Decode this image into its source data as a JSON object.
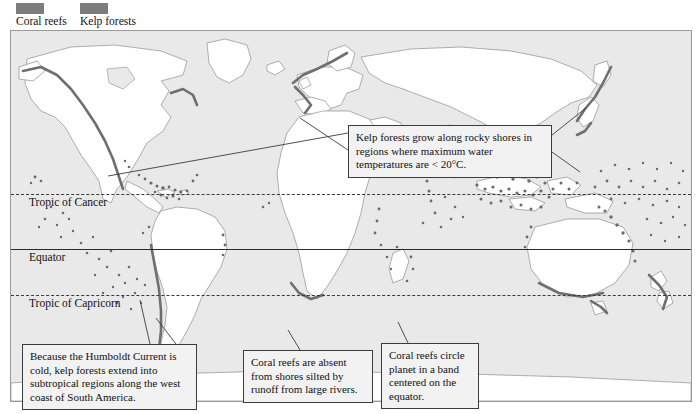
{
  "legend": {
    "items": [
      {
        "label": "Coral reefs",
        "color": "#7d7d7d",
        "name": "coral-reefs"
      },
      {
        "label": "Kelp forests",
        "color": "#7d7d7d",
        "name": "kelp-forests"
      }
    ]
  },
  "map": {
    "ocean_color": "#e9e9e9",
    "land_color": "#ffffff",
    "border_color": "#9a9a9a",
    "latitude_lines": [
      {
        "label": "Tropic of Cancer",
        "style": "dashed"
      },
      {
        "label": "Equator",
        "style": "solid"
      },
      {
        "label": "Tropic of Capricorn",
        "style": "dashed"
      }
    ]
  },
  "callouts": [
    {
      "name": "kelp-temperature",
      "text": "Kelp forests grow along rocky shores in regions where maximum water temperatures are < 20°C."
    },
    {
      "name": "humboldt-current",
      "text": "Because the Humboldt Current is cold, kelp forests extend into subtropical regions along the west coast of South America."
    },
    {
      "name": "coral-silt",
      "text": "Coral reefs are absent from shores silted by runoff from large rivers."
    },
    {
      "name": "coral-band",
      "text": "Coral reefs circle planet in a band centered on the equator."
    }
  ]
}
